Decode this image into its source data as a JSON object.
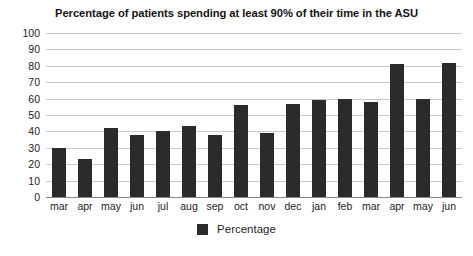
{
  "chart_data": {
    "type": "bar",
    "title": "Percentage of patients spending at least 90% of their time in the ASU",
    "xlabel": "",
    "ylabel": "",
    "ylim": [
      0,
      100
    ],
    "ytick_step": 10,
    "yticks": [
      100,
      90,
      80,
      70,
      60,
      50,
      40,
      30,
      20,
      10,
      0
    ],
    "grid": true,
    "legend_position": "bottom-center",
    "categories": [
      "mar",
      "apr",
      "may",
      "jun",
      "jul",
      "aug",
      "sep",
      "oct",
      "nov",
      "dec",
      "jan",
      "feb",
      "mar",
      "apr",
      "may",
      "jun"
    ],
    "series": [
      {
        "name": "Percentage",
        "color": "#2b2b2b",
        "values": [
          30,
          23,
          42,
          38,
          40,
          43,
          38,
          56,
          39,
          57,
          59,
          60,
          58,
          81,
          60,
          82
        ]
      }
    ]
  },
  "legend": {
    "items": [
      {
        "label": "Percentage",
        "color": "#2b2b2b",
        "swatch": "square-swatch-icon"
      }
    ]
  },
  "colors": {
    "bar": "#2b2b2b",
    "gridline": "#c9c9c9",
    "axis": "#8a8a8a",
    "background": "#ffffff",
    "text": "#232323"
  }
}
